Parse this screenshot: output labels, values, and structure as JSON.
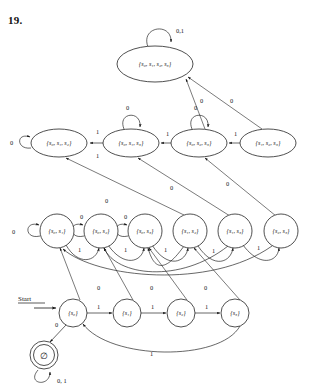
{
  "figure": {
    "exercise_number": "19.",
    "alphabet": [
      "0",
      "1"
    ],
    "start_label": "Start",
    "empty_set_symbol": "∅"
  },
  "states": [
    {
      "id": "s0123",
      "label": "{s₀, s₁, s₂, s₃}",
      "members": [
        "s0",
        "s1",
        "s2",
        "s3"
      ],
      "shape": "ellipse",
      "accepting": false,
      "x": 155,
      "y": 64,
      "rx": 38,
      "ry": 18,
      "row": "row-4"
    },
    {
      "id": "s012",
      "label": "{s₀, s₁, s₂}",
      "members": [
        "s0",
        "s1",
        "s2"
      ],
      "shape": "ellipse",
      "accepting": false,
      "x": 59,
      "y": 143,
      "rx": 28,
      "ry": 14,
      "row": "row-3"
    },
    {
      "id": "s013",
      "label": "{s₀, s₁, s₃}",
      "members": [
        "s0",
        "s1",
        "s3"
      ],
      "shape": "ellipse",
      "accepting": false,
      "x": 131,
      "y": 143,
      "rx": 28,
      "ry": 14,
      "row": "row-3"
    },
    {
      "id": "s023",
      "label": "{s₀, s₂, s₃}",
      "members": [
        "s0",
        "s2",
        "s3"
      ],
      "shape": "ellipse",
      "accepting": false,
      "x": 199,
      "y": 143,
      "rx": 28,
      "ry": 14,
      "row": "row-3"
    },
    {
      "id": "s123",
      "label": "{s₁, s₂, s₃}",
      "members": [
        "s1",
        "s2",
        "s3"
      ],
      "shape": "ellipse",
      "accepting": false,
      "x": 268,
      "y": 143,
      "rx": 28,
      "ry": 14,
      "row": "row-3"
    },
    {
      "id": "s01",
      "label": "{s₀, s₁}",
      "members": [
        "s0",
        "s1"
      ],
      "shape": "circle",
      "accepting": false,
      "x": 57,
      "y": 231,
      "rx": 17,
      "ry": 17,
      "row": "row-2"
    },
    {
      "id": "s02",
      "label": "{s₀, s₂}",
      "members": [
        "s0",
        "s2"
      ],
      "shape": "circle",
      "accepting": false,
      "x": 101,
      "y": 231,
      "rx": 17,
      "ry": 17,
      "row": "row-2"
    },
    {
      "id": "s03",
      "label": "{s₀, s₃}",
      "members": [
        "s0",
        "s3"
      ],
      "shape": "circle",
      "accepting": false,
      "x": 145,
      "y": 231,
      "rx": 17,
      "ry": 17,
      "row": "row-2"
    },
    {
      "id": "s12",
      "label": "{s₁, s₂}",
      "members": [
        "s1",
        "s2"
      ],
      "shape": "circle",
      "accepting": false,
      "x": 190,
      "y": 231,
      "rx": 17,
      "ry": 17,
      "row": "row-2"
    },
    {
      "id": "s13",
      "label": "{s₁, s₃}",
      "members": [
        "s1",
        "s3"
      ],
      "shape": "circle",
      "accepting": false,
      "x": 235,
      "y": 231,
      "rx": 17,
      "ry": 17,
      "row": "row-2"
    },
    {
      "id": "s23",
      "label": "{s₂, s₃}",
      "members": [
        "s2",
        "s3"
      ],
      "shape": "circle",
      "accepting": false,
      "x": 281,
      "y": 231,
      "rx": 17,
      "ry": 17,
      "row": "row-2"
    },
    {
      "id": "s0",
      "label": "{s₀}",
      "members": [
        "s0"
      ],
      "shape": "circle",
      "accepting": false,
      "x": 73,
      "y": 313,
      "rx": 14,
      "ry": 14,
      "row": "row-1"
    },
    {
      "id": "s1",
      "label": "{s₁}",
      "members": [
        "s1"
      ],
      "shape": "circle",
      "accepting": false,
      "x": 127,
      "y": 313,
      "rx": 14,
      "ry": 14,
      "row": "row-1"
    },
    {
      "id": "s2",
      "label": "{s₂}",
      "members": [
        "s2"
      ],
      "shape": "circle",
      "accepting": false,
      "x": 181,
      "y": 313,
      "rx": 14,
      "ry": 14,
      "row": "row-1"
    },
    {
      "id": "s3",
      "label": "{s₃}",
      "members": [
        "s3"
      ],
      "shape": "circle",
      "accepting": false,
      "x": 235,
      "y": 313,
      "rx": 14,
      "ry": 14,
      "row": "row-1"
    },
    {
      "id": "empty",
      "label": "∅",
      "members": [],
      "shape": "double-circle",
      "accepting": true,
      "x": 44,
      "y": 355,
      "rx": 14,
      "ry": 14,
      "row": "row-0"
    }
  ],
  "transitions": [
    {
      "from": "s0123",
      "to": "s0123",
      "label": "0,1",
      "kind": "self-loop",
      "label_x": 176,
      "label_y": 33
    },
    {
      "from": "s012",
      "to": "s012",
      "label": "0",
      "kind": "self-loop",
      "label_x": 10,
      "label_y": 145
    },
    {
      "from": "s013",
      "to": "s013",
      "label": "0",
      "kind": "self-loop",
      "label_x": 126,
      "label_y": 110
    },
    {
      "from": "s023",
      "to": "s023",
      "label": "0",
      "kind": "self-loop",
      "label_x": 194,
      "label_y": 110
    },
    {
      "from": "s013",
      "to": "s012",
      "label": "1",
      "kind": "straight",
      "label_x": 96,
      "label_y": 134
    },
    {
      "from": "s012",
      "to": "s013",
      "label": "1",
      "kind": "straight",
      "label_x": 96,
      "label_y": 156
    },
    {
      "from": "s023",
      "to": "s013",
      "label": "1",
      "kind": "straight",
      "label_x": 166,
      "label_y": 136
    },
    {
      "from": "s123",
      "to": "s023",
      "label": "1",
      "kind": "straight",
      "label_x": 234,
      "label_y": 136
    },
    {
      "from": "s123",
      "to": "s0123",
      "label": "0",
      "kind": "diagonal",
      "label_x": 230,
      "label_y": 103
    },
    {
      "from": "s023",
      "to": "s0123",
      "label": "0",
      "kind": "diagonal",
      "label_x": 205,
      "label_y": 103
    },
    {
      "from": "s01",
      "to": "s01",
      "label": "0",
      "kind": "self-loop",
      "label_x": 12,
      "label_y": 234
    },
    {
      "from": "s02",
      "to": "s02",
      "label": "0",
      "kind": "self-loop",
      "label_x": 80,
      "label_y": 218
    },
    {
      "from": "s03",
      "to": "s03",
      "label": "0",
      "kind": "self-loop",
      "label_x": 124,
      "label_y": 218
    },
    {
      "from": "s12",
      "to": "s012",
      "label": "0",
      "kind": "diagonal",
      "label_x": 105,
      "label_y": 203
    },
    {
      "from": "s13",
      "to": "s013",
      "label": "0",
      "kind": "diagonal",
      "label_x": 170,
      "label_y": 190
    },
    {
      "from": "s23",
      "to": "s023",
      "label": "0",
      "kind": "diagonal",
      "label_x": 226,
      "label_y": 186
    },
    {
      "from": "s01",
      "to": "s02",
      "label": "1",
      "kind": "arc",
      "label_x": 78,
      "label_y": 251
    },
    {
      "from": "s02",
      "to": "s03",
      "label": "1",
      "kind": "arc",
      "label_x": 124,
      "label_y": 251
    },
    {
      "from": "s03",
      "to": "s12",
      "label": "1",
      "kind": "arc",
      "label_x": 164,
      "label_y": 251
    },
    {
      "from": "s12",
      "to": "s13",
      "label": "1",
      "kind": "arc",
      "label_x": 212,
      "label_y": 252
    },
    {
      "from": "s13",
      "to": "s23",
      "label": "1",
      "kind": "arc",
      "label_x": 257,
      "label_y": 249
    },
    {
      "from": "s0",
      "to": "s01",
      "label": "0",
      "kind": "diagonal",
      "label_x": 100,
      "label_y": 289
    },
    {
      "from": "s1",
      "to": "s02",
      "label": "0",
      "kind": "diagonal",
      "label_x": 150,
      "label_y": 289
    },
    {
      "from": "s2",
      "to": "s03",
      "label": "0",
      "kind": "diagonal",
      "label_x": 204,
      "label_y": 289
    },
    {
      "from": "s0",
      "to": "s1",
      "label": "1",
      "kind": "straight",
      "label_x": 99,
      "label_y": 308
    },
    {
      "from": "s1",
      "to": "s2",
      "label": "1",
      "kind": "straight",
      "label_x": 153,
      "label_y": 308
    },
    {
      "from": "s2",
      "to": "s3",
      "label": "1",
      "kind": "straight",
      "label_x": 207,
      "label_y": 308
    },
    {
      "from": "s3",
      "to": "s0",
      "label": "1",
      "kind": "arc",
      "label_x": 150,
      "label_y": 355
    },
    {
      "from": "s0",
      "to": "empty",
      "label": "0",
      "kind": "diagonal",
      "label_x": 56,
      "label_y": 326
    },
    {
      "from": "empty",
      "to": "empty",
      "label": "0, 1",
      "kind": "self-loop",
      "label_x": 58,
      "label_y": 382
    }
  ],
  "start_arrow": {
    "label": "Start",
    "x": 20,
    "y": 308
  }
}
